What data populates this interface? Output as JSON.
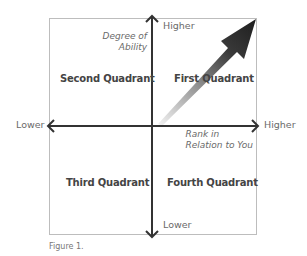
{
  "diagram": {
    "quadrants": {
      "first": "First Quadrant",
      "second": "Second Quadrant",
      "third": "Third Quadrant",
      "fourth": "Fourth Quadrant"
    },
    "vertical_axis": {
      "title_line1": "Degree of",
      "title_line2": "Ability",
      "top_label": "Higher",
      "bottom_label": "Lower"
    },
    "horizontal_axis": {
      "title_line1": "Rank in",
      "title_line2": "Relation to You",
      "left_label": "Lower",
      "right_label": "Higher"
    },
    "trend_arrow": {
      "direction": "toward upper-right (higher rank, higher ability)",
      "color_start": "#e8e8e8",
      "color_end": "#2a2a2a"
    },
    "caption": "Figure 1.",
    "colors": {
      "axis": "#333333",
      "frame": "#b8b8b8",
      "quadrant_text": "#444444",
      "label_text": "#6a6a6a"
    }
  }
}
